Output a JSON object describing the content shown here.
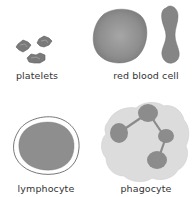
{
  "diagram": {
    "cells": [
      {
        "id": "platelets",
        "label": "platelets"
      },
      {
        "id": "red_blood_cell",
        "label": "red blood cell"
      },
      {
        "id": "lymphocyte",
        "label": "lymphocyte"
      },
      {
        "id": "phagocyte",
        "label": "phagocyte"
      }
    ],
    "colors": {
      "cell_fill": "#8c8c8c",
      "cell_fill_dark": "#7a7a7a",
      "phagocyte_cytoplasm": "#d9d9d9",
      "outline": "#555555",
      "text": "#333333",
      "background": "#ffffff"
    }
  }
}
